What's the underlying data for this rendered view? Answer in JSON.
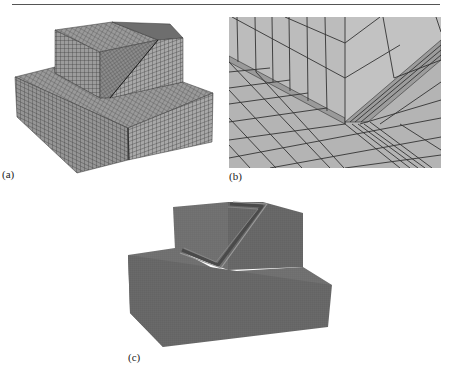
{
  "page": {
    "header_text": "",
    "figure": {
      "panels": [
        {
          "id": "a",
          "label": "(a)",
          "description": "Hexahedral mesh of stepped block with inclined feature"
        },
        {
          "id": "b",
          "label": "(b)",
          "description": "Close-up of mesh near inclined edge"
        },
        {
          "id": "c",
          "label": "(c)",
          "description": "Refined mesh of stepped block with inclined groove"
        }
      ]
    },
    "colors": {
      "mesh_face_light": "#a6a6a6",
      "mesh_face_mid": "#8f8f8f",
      "mesh_face_dark": "#6e6e6e",
      "mesh_line": "#3a3a3a",
      "closeup_face": "#b4b4b4",
      "refined_face": "#6b6b6b"
    }
  }
}
